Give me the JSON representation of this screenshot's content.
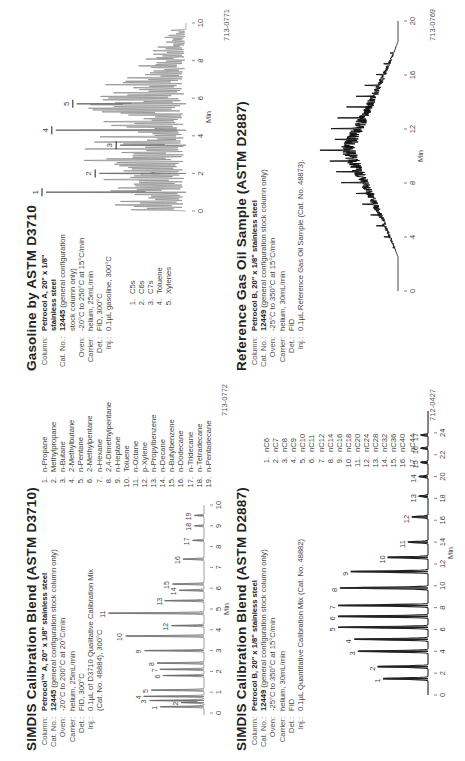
{
  "panels": {
    "simdis_d3710": {
      "title": "SIMDIS Calibration Blend (ASTM D3710)",
      "params": [
        {
          "label": "Column:",
          "value_bold": "Petrocol™ A, 20\" x 1/8\" stainless steel",
          "value": ""
        },
        {
          "label": "Cat. No.:",
          "value_bold": "12445",
          "value": " (general configuration stock column only)"
        },
        {
          "label": "Oven:",
          "value_bold": "",
          "value": "-20°C to 200°C at 20°C/min"
        },
        {
          "label": "Carrier:",
          "value_bold": "",
          "value": "helium, 25mL/min"
        },
        {
          "label": "Det.:",
          "value_bold": "",
          "value": "FID, 300°C"
        },
        {
          "label": "Inj.:",
          "value_bold": "",
          "value": "0.1µL of D3710 Qualitative Calibration Mix"
        },
        {
          "label": "",
          "value_bold": "",
          "value": "(Cat. No. 48884), 300°C"
        }
      ],
      "peaks": [
        "n-Propane",
        "Methylpropane",
        "n-Butane",
        "2-Methylbutane",
        "n-Pentane",
        "2-Methylpentane",
        "n-Hexane",
        "2,4-Dimethylpentane",
        "n-Heptane",
        "Toluene",
        "n-Octane",
        "p-Xylene",
        "n-Propylbenzene",
        "n-Decane",
        "n-Butylbenzene",
        "n-Dodecane",
        "n-Tridecane",
        "n-Tetradecane",
        "n-Pentadecane"
      ],
      "figure_id": "713-0772"
    },
    "simdis_d2887": {
      "title": "SIMDIS Calibration Blend (ASTM D2887)",
      "params": [
        {
          "label": "Column:",
          "value_bold": "Petrocol B, 20\" x 1/8\" stainless steel",
          "value": ""
        },
        {
          "label": "Cat. No.:",
          "value_bold": "12449",
          "value": " (general configuration stock column only)"
        },
        {
          "label": "Oven:",
          "value_bold": "",
          "value": "-25°C to 350°C at 15°C/min"
        },
        {
          "label": "Carrier:",
          "value_bold": "",
          "value": "helium, 30mL/min"
        },
        {
          "label": "Det.:",
          "value_bold": "",
          "value": "FID"
        },
        {
          "label": "Inj.:",
          "value_bold": "",
          "value": "0.1µL Quantitative Calibration Mix (Cat. No. 48882)"
        }
      ],
      "peaks": [
        "nC6",
        "nC7",
        "nC8",
        "nC9",
        "nC10",
        "nC11",
        "nC12",
        "nC14",
        "nC16",
        "nC18",
        "nC20",
        "nC24",
        "nC28",
        "nC32",
        "nC36",
        "nC40",
        "nC44"
      ],
      "figure_id": "712-0427"
    },
    "gasoline_d3710": {
      "title": "Gasoline by ASTM D3710",
      "params": [
        {
          "label": "Column:",
          "value_bold": "Petrocol A, 20\" x 1/8\"",
          "value": ""
        },
        {
          "label": "",
          "value_bold": "stainless steel",
          "value": ""
        },
        {
          "label": "Cat. No.:",
          "value_bold": "12445",
          "value": " (general configuration"
        },
        {
          "label": "",
          "value_bold": "",
          "value": "stock column only)"
        },
        {
          "label": "Oven:",
          "value_bold": "",
          "value": "-20°C to 250°C at 15°C/min"
        },
        {
          "label": "Carrier:",
          "value_bold": "",
          "value": "helium, 25mL/min"
        },
        {
          "label": "Det.:",
          "value_bold": "",
          "value": "FID, 300°C"
        },
        {
          "label": "Inj.:",
          "value_bold": "",
          "value": "0.1µL gasoline, 300°C"
        }
      ],
      "peaks": [
        "C5s",
        "C6s",
        "C7s",
        "Toluene",
        "Xylenes"
      ],
      "figure_id": "713-0771"
    },
    "reference_gas_oil": {
      "title": "Reference Gas Oil Sample (ASTM D2887)",
      "params": [
        {
          "label": "Column:",
          "value_bold": "Petrocol B, 20\" x 1/8\" stainless steel",
          "value": ""
        },
        {
          "label": "Cat. No.:",
          "value_bold": "12449",
          "value": " (general configuration stock column only)"
        },
        {
          "label": "Oven:",
          "value_bold": "",
          "value": "-25°C to 350°C at 15°C/min"
        },
        {
          "label": "Carrier:",
          "value_bold": "",
          "value": "helium, 30mL/min"
        },
        {
          "label": "Det.:",
          "value_bold": "",
          "value": "FID"
        },
        {
          "label": "Inj.:",
          "value_bold": "",
          "value": "0.1µL Reference Gas Oil Sample (Cat. No. 48873)."
        }
      ],
      "figure_id": "713-0769"
    }
  },
  "chart_data": [
    {
      "id": "simdis_d3710",
      "type": "line",
      "title": "SIMDIS Calibration Blend (ASTM D3710)",
      "xlabel": "Min",
      "ylabel": "",
      "xlim": [
        0,
        10
      ],
      "x_ticks": [
        0,
        1,
        2,
        3,
        4,
        5,
        6,
        7,
        8,
        9,
        10
      ],
      "grid": false,
      "peaks": [
        {
          "label": "1",
          "t": 0.3,
          "h": 0.46
        },
        {
          "label": "2",
          "t": 0.5,
          "h": 0.24
        },
        {
          "label": "3",
          "t": 0.6,
          "h": 0.57
        },
        {
          "label": "4",
          "t": 0.8,
          "h": 0.63
        },
        {
          "label": "5",
          "t": 1.1,
          "h": 0.55
        },
        {
          "label": "6",
          "t": 1.8,
          "h": 0.43
        },
        {
          "label": "7",
          "t": 2.1,
          "h": 0.46
        },
        {
          "label": "8",
          "t": 2.4,
          "h": 0.49
        },
        {
          "label": "9",
          "t": 3.0,
          "h": 0.62
        },
        {
          "label": "10",
          "t": 3.7,
          "h": 0.82
        },
        {
          "label": "11",
          "t": 4.8,
          "h": 1.0
        },
        {
          "label": "12",
          "t": 4.2,
          "h": 0.34
        },
        {
          "label": "13",
          "t": 5.4,
          "h": 0.41
        },
        {
          "label": "14",
          "t": 5.9,
          "h": 0.26
        },
        {
          "label": "15",
          "t": 6.2,
          "h": 0.33
        },
        {
          "label": "16",
          "t": 7.4,
          "h": 0.22
        },
        {
          "label": "17",
          "t": 8.3,
          "h": 0.12
        },
        {
          "label": "18",
          "t": 9.0,
          "h": 0.1
        },
        {
          "label": "19",
          "t": 9.5,
          "h": 0.1
        }
      ]
    },
    {
      "id": "simdis_d2887",
      "type": "line",
      "title": "SIMDIS Calibration Blend (ASTM D2887)",
      "xlabel": "Min",
      "ylabel": "",
      "xlim": [
        0,
        26
      ],
      "x_ticks": [
        0,
        2,
        4,
        6,
        8,
        10,
        12,
        14,
        16,
        18,
        20,
        22,
        24
      ],
      "grid": false,
      "peaks": [
        {
          "label": "1",
          "t": 1.5,
          "h": 0.5
        },
        {
          "label": "2",
          "t": 2.6,
          "h": 0.56
        },
        {
          "label": "3",
          "t": 4.0,
          "h": 0.78
        },
        {
          "label": "4",
          "t": 5.1,
          "h": 0.82
        },
        {
          "label": "5",
          "t": 6.2,
          "h": 1.0
        },
        {
          "label": "6",
          "t": 7.2,
          "h": 1.0
        },
        {
          "label": "7",
          "t": 8.2,
          "h": 1.0
        },
        {
          "label": "8",
          "t": 9.8,
          "h": 0.98
        },
        {
          "label": "9",
          "t": 11.3,
          "h": 0.86
        },
        {
          "label": "10",
          "t": 12.6,
          "h": 0.45
        },
        {
          "label": "11",
          "t": 14.0,
          "h": 0.22
        },
        {
          "label": "12",
          "t": 16.3,
          "h": 0.18
        },
        {
          "label": "13",
          "t": 18.2,
          "h": 0.1
        },
        {
          "label": "14",
          "t": 20.0,
          "h": 0.1
        },
        {
          "label": "15",
          "t": 21.3,
          "h": 0.08
        },
        {
          "label": "16",
          "t": 22.6,
          "h": 0.08
        },
        {
          "label": "17",
          "t": 23.8,
          "h": 0.08
        }
      ]
    },
    {
      "id": "gasoline_d3710",
      "type": "line",
      "title": "Gasoline by ASTM D3710",
      "xlabel": "Min",
      "ylabel": "",
      "xlim": [
        0,
        10
      ],
      "x_ticks": [
        0,
        2,
        4,
        6,
        8,
        10
      ],
      "grid": false,
      "labeled_peaks": [
        {
          "label": "1",
          "t": 1.0,
          "h": 1.0
        },
        {
          "label": "2",
          "t": 2.0,
          "h": 0.62
        },
        {
          "label": "3",
          "t": 3.5,
          "h": 0.47
        },
        {
          "label": "4",
          "t": 4.3,
          "h": 0.93
        },
        {
          "label": "5",
          "t": 5.7,
          "h": 0.78
        }
      ]
    },
    {
      "id": "reference_gas_oil",
      "type": "line",
      "title": "Reference Gas Oil Sample (ASTM D2887)",
      "xlabel": "Min",
      "ylabel": "",
      "xlim": [
        0,
        20
      ],
      "x_ticks": [
        0,
        4,
        8,
        12,
        16,
        20
      ],
      "grid": false,
      "envelope": {
        "start_min": 2.5,
        "apex_min": 10.5,
        "end_min": 18.5,
        "apex_h": 1.0
      }
    }
  ]
}
